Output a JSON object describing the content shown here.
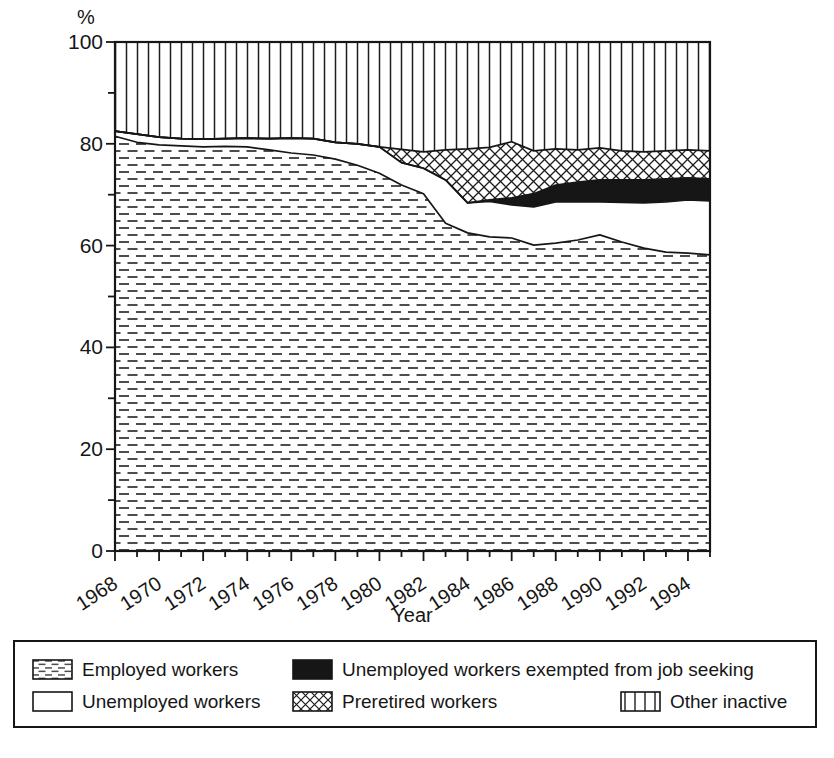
{
  "page": {
    "background": "#ffffff"
  },
  "colors": {
    "ink": "#161616",
    "dash_fill": "#4d4d4d",
    "background": "#ffffff"
  },
  "chart_data": {
    "type": "area",
    "stacked": true,
    "title": "",
    "xlabel": "Year",
    "ylabel": "%",
    "x_range": [
      1968,
      1995
    ],
    "ylim": [
      0,
      100
    ],
    "grid": false,
    "legend_position": "bottom",
    "y_tick_labels": [
      0,
      20,
      40,
      60,
      80,
      100
    ],
    "y_minor_tick_step": 10,
    "x_tick_labels": [
      1968,
      1970,
      1972,
      1974,
      1976,
      1978,
      1980,
      1982,
      1984,
      1986,
      1988,
      1990,
      1992,
      1994
    ],
    "x_minor_tick_step": 1,
    "years": [
      1968,
      1969,
      1970,
      1971,
      1972,
      1973,
      1974,
      1975,
      1976,
      1977,
      1978,
      1979,
      1980,
      1981,
      1982,
      1983,
      1984,
      1985,
      1986,
      1987,
      1988,
      1989,
      1990,
      1991,
      1992,
      1993,
      1994,
      1995
    ],
    "series": [
      {
        "name": "Employed workers",
        "pattern": "dashes",
        "values": [
          81.5,
          80.3,
          79.8,
          79.6,
          79.4,
          79.5,
          79.4,
          78.8,
          78.2,
          77.8,
          77.0,
          75.8,
          74.2,
          71.9,
          70.2,
          64.4,
          62.5,
          61.7,
          61.5,
          60.1,
          60.5,
          61.1,
          62.1,
          60.7,
          59.5,
          58.7,
          58.5,
          58.2
        ]
      },
      {
        "name": "Unemployed workers",
        "pattern": "white",
        "values": [
          1.0,
          1.6,
          1.5,
          1.4,
          1.5,
          1.5,
          1.7,
          2.2,
          2.9,
          3.2,
          3.3,
          4.2,
          5.2,
          4.4,
          5.0,
          8.5,
          5.9,
          7.0,
          6.5,
          7.5,
          8.1,
          7.5,
          6.5,
          7.8,
          8.9,
          9.9,
          10.5,
          10.6
        ]
      },
      {
        "name": "Unemployed workers exempted from job seeking",
        "pattern": "solid",
        "values": [
          0,
          0,
          0,
          0,
          0,
          0,
          0,
          0,
          0,
          0,
          0,
          0,
          0,
          0,
          0,
          0,
          0,
          0.3,
          1.4,
          2.6,
          3.3,
          3.9,
          4.3,
          4.4,
          4.5,
          4.5,
          4.3,
          4.3
        ]
      },
      {
        "name": "Preretired workers",
        "pattern": "crosshatch",
        "values": [
          0,
          0,
          0,
          0,
          0,
          0,
          0,
          0,
          0,
          0,
          0,
          0,
          0,
          2.6,
          3.2,
          5.9,
          10.6,
          10.3,
          11.0,
          8.4,
          7.1,
          6.3,
          6.3,
          5.7,
          5.5,
          5.5,
          5.5,
          5.5
        ]
      },
      {
        "name": "Other inactive",
        "pattern": "vlines",
        "values": [
          17.5,
          18.1,
          18.7,
          19.0,
          19.1,
          19.0,
          18.9,
          19.0,
          18.9,
          19.0,
          19.7,
          20.0,
          20.6,
          21.1,
          21.6,
          21.2,
          21.0,
          20.7,
          19.6,
          21.4,
          21.0,
          21.2,
          20.8,
          21.4,
          21.6,
          21.4,
          21.2,
          21.4
        ]
      }
    ]
  },
  "legend": {
    "items": [
      {
        "label": "Employed workers",
        "pattern": "dashes"
      },
      {
        "label": "Unemployed workers",
        "pattern": "white"
      },
      {
        "label": "Unemployed workers exempted from job seeking",
        "pattern": "solid"
      },
      {
        "label": "Preretired workers",
        "pattern": "crosshatch"
      },
      {
        "label": "Other inactive",
        "pattern": "vlines"
      }
    ]
  }
}
